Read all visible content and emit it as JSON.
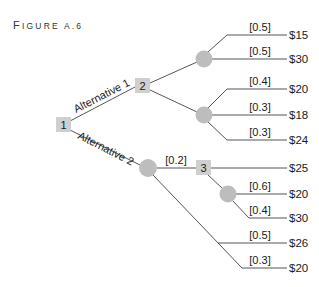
{
  "figure": {
    "title_first": "F",
    "title_rest": "IGURE A.6"
  },
  "nodes": {
    "decision_1": "1",
    "decision_2": "2",
    "decision_3": "3"
  },
  "branches": {
    "alternative_1": "Alternative 1",
    "alternative_2": "Alternative 2"
  },
  "probabilities": {
    "a1_top_1": "[0.5]",
    "a1_top_2": "[0.5]",
    "a1_bot_1": "[0.4]",
    "a1_bot_2": "[0.3]",
    "a1_bot_3": "[0.3]",
    "a2_to_3": "[0.2]",
    "n3_chance_1": "[0.6]",
    "n3_chance_2": "[0.4]",
    "a2_2": "[0.5]",
    "a2_3": "[0.3]"
  },
  "payoffs": {
    "p1": "$15",
    "p2": "$30",
    "p3": "$20",
    "p4": "$18",
    "p5": "$24",
    "p6": "$25",
    "p7": "$20",
    "p8": "$30",
    "p9": "$26",
    "p10": "$20"
  },
  "colors": {
    "decision_node": "#cfcfcf",
    "chance_node": "#bdbdbd",
    "edge": "#555555"
  }
}
